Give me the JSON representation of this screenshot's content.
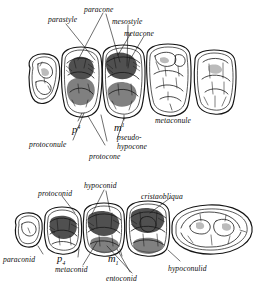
{
  "figure": {
    "background_color": "#ffffff",
    "ink_color": "#111111",
    "style": "pen-and-ink scientific illustration, italic handwritten labels"
  },
  "upper_row": {
    "caption": "upper dentition, occlusal view",
    "tooth_labels": [
      {
        "name": "p4-label",
        "text": "p",
        "superscript": "4"
      },
      {
        "name": "m1-label",
        "text": "m",
        "superscript": "1"
      }
    ],
    "cusp_labels": [
      {
        "name": "parastyle-label",
        "text": "parastyle"
      },
      {
        "name": "paracone-label",
        "text": "paracone"
      },
      {
        "name": "mesostyle-label",
        "text": "mesostyle"
      },
      {
        "name": "metacone-label",
        "text": "metacone"
      },
      {
        "name": "metaconule-label",
        "text": "metaconule"
      },
      {
        "name": "protoconule-label",
        "text": "protoconule"
      },
      {
        "name": "protocone-label",
        "text": "protocone"
      },
      {
        "name": "pseudo-hypocone-label-line1",
        "text": "pseudo-"
      },
      {
        "name": "pseudo-hypocone-label-line2",
        "text": "hypocone"
      }
    ],
    "tooth_count": 5
  },
  "lower_row": {
    "caption": "lower dentition, occlusal view",
    "tooth_labels": [
      {
        "name": "p4-lower-label",
        "text": "p",
        "subscript": "4"
      },
      {
        "name": "m1-lower-label",
        "text": "m",
        "subscript": "1"
      }
    ],
    "cusp_labels": [
      {
        "name": "protoconid-label",
        "text": "protoconid"
      },
      {
        "name": "hypoconid-label",
        "text": "hypoconid"
      },
      {
        "name": "cristaobliqua-label",
        "text": "cristaobliqua"
      },
      {
        "name": "paraconid-label",
        "text": "paraconid"
      },
      {
        "name": "metaconid-label",
        "text": "metaconid"
      },
      {
        "name": "entoconid-label",
        "text": "entoconid"
      },
      {
        "name": "hypoconulid-label",
        "text": "hypoconulid"
      }
    ],
    "tooth_count": 5
  }
}
